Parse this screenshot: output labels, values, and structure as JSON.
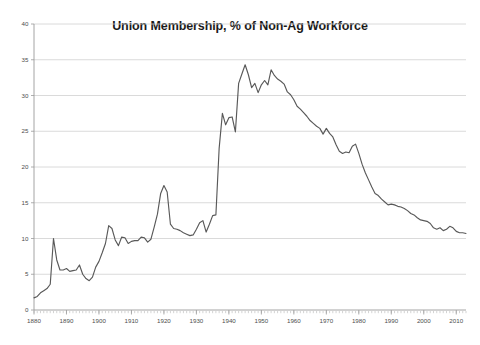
{
  "chart_data": {
    "type": "line",
    "title": "Union Membership, % of Non-Ag Workforce",
    "xlabel": "",
    "ylabel": "",
    "xlim": [
      1880,
      2013
    ],
    "ylim": [
      0,
      40
    ],
    "yticks": [
      0,
      5,
      10,
      15,
      20,
      25,
      30,
      35,
      40
    ],
    "xticks": [
      1880,
      1890,
      1900,
      1910,
      1920,
      1930,
      1940,
      1950,
      1960,
      1970,
      1980,
      1990,
      2000,
      2010
    ],
    "grid": "horizontal",
    "legend": "none",
    "line_color": "#595959",
    "grid_color": "#d0d0d0",
    "axis_color": "#9a9a9a",
    "series": [
      {
        "name": "Union Membership, % of Non-Ag Workforce",
        "x": [
          1880,
          1881,
          1882,
          1883,
          1884,
          1885,
          1886,
          1887,
          1888,
          1889,
          1890,
          1891,
          1892,
          1893,
          1894,
          1895,
          1896,
          1897,
          1898,
          1899,
          1900,
          1901,
          1902,
          1903,
          1904,
          1905,
          1906,
          1907,
          1908,
          1909,
          1910,
          1911,
          1912,
          1913,
          1914,
          1915,
          1916,
          1917,
          1918,
          1919,
          1920,
          1921,
          1922,
          1923,
          1924,
          1925,
          1926,
          1927,
          1928,
          1929,
          1930,
          1931,
          1932,
          1933,
          1934,
          1935,
          1936,
          1937,
          1938,
          1939,
          1940,
          1941,
          1942,
          1943,
          1944,
          1945,
          1946,
          1947,
          1948,
          1949,
          1950,
          1951,
          1952,
          1953,
          1954,
          1955,
          1956,
          1957,
          1958,
          1959,
          1960,
          1961,
          1962,
          1963,
          1964,
          1965,
          1966,
          1967,
          1968,
          1969,
          1970,
          1971,
          1972,
          1973,
          1974,
          1975,
          1976,
          1977,
          1978,
          1979,
          1980,
          1981,
          1982,
          1983,
          1984,
          1985,
          1986,
          1987,
          1988,
          1989,
          1990,
          1991,
          1992,
          1993,
          1994,
          1995,
          1996,
          1997,
          1998,
          1999,
          2000,
          2001,
          2002,
          2003,
          2004,
          2005,
          2006,
          2007,
          2008,
          2009,
          2010,
          2011,
          2012,
          2013
        ],
        "values": [
          1.7,
          1.9,
          2.4,
          2.7,
          3.0,
          3.6,
          10.0,
          7.0,
          5.6,
          5.6,
          5.8,
          5.4,
          5.5,
          5.6,
          6.3,
          5.0,
          4.4,
          4.1,
          4.6,
          6.0,
          6.8,
          8.0,
          9.3,
          11.8,
          11.4,
          9.8,
          9.0,
          10.2,
          10.1,
          9.3,
          9.6,
          9.7,
          9.7,
          10.2,
          10.1,
          9.5,
          9.9,
          11.6,
          13.4,
          16.3,
          17.4,
          16.5,
          12.0,
          11.4,
          11.3,
          11.1,
          10.8,
          10.6,
          10.4,
          10.5,
          11.3,
          12.2,
          12.5,
          10.9,
          12.0,
          13.2,
          13.3,
          22.6,
          27.5,
          25.9,
          26.9,
          27.0,
          24.9,
          31.7,
          33.0,
          34.3,
          32.9,
          31.1,
          31.7,
          30.4,
          31.5,
          32.1,
          31.5,
          33.6,
          32.8,
          32.3,
          32.0,
          31.6,
          30.5,
          30.1,
          29.4,
          28.5,
          28.1,
          27.6,
          27.1,
          26.5,
          26.1,
          25.7,
          25.4,
          24.6,
          25.4,
          24.7,
          24.2,
          23.1,
          22.2,
          21.9,
          22.1,
          22.0,
          22.9,
          23.2,
          21.9,
          20.4,
          19.2,
          18.2,
          17.2,
          16.3,
          16.0,
          15.5,
          15.1,
          14.7,
          14.8,
          14.7,
          14.5,
          14.4,
          14.2,
          13.9,
          13.5,
          13.3,
          12.9,
          12.6,
          12.5,
          12.4,
          12.1,
          11.5,
          11.3,
          11.5,
          11.1,
          11.3,
          11.7,
          11.5,
          11.0,
          10.8,
          10.8,
          10.7
        ]
      }
    ]
  },
  "plot_geometry": {
    "left": 34,
    "right": 466,
    "top": 24,
    "bottom": 310
  }
}
